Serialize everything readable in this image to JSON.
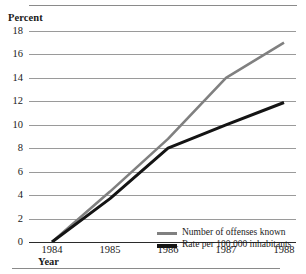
{
  "chart_data": {
    "type": "line",
    "title": "",
    "subtitle": "",
    "ylabel": "Percent",
    "xlabel": "Year",
    "x": [
      "1984",
      "1985",
      "1986",
      "1987",
      "1988"
    ],
    "categories": [
      "1984",
      "1985",
      "1986",
      "1987",
      "1988"
    ],
    "xlim": [
      1984,
      1988
    ],
    "ylim": [
      0,
      18
    ],
    "yticks": [
      "18",
      "16",
      "14",
      "12",
      "10",
      "8",
      "6",
      "4",
      "2",
      "0"
    ],
    "ytick_values": [
      18,
      16,
      14,
      12,
      10,
      8,
      6,
      4,
      2,
      0
    ],
    "xticks": [
      "1984",
      "1985",
      "1986",
      "1987",
      "1988"
    ],
    "grid": "horizontal",
    "legend_position": "inside-center-lower",
    "series": [
      {
        "name": "Number of offenses known",
        "color": "#808080",
        "values": [
          0,
          4.3,
          8.8,
          14.0,
          17.0
        ]
      },
      {
        "name": "Rate per 100,000 inhabitants",
        "color": "#141414",
        "values": [
          0,
          3.7,
          8.0,
          10.0,
          11.9
        ]
      }
    ],
    "annotations": []
  },
  "legend": {
    "items": [
      {
        "label": "Number of offenses known",
        "color": "#808080"
      },
      {
        "label": "Rate per 100,000 inhabitants",
        "color": "#141414"
      }
    ]
  },
  "colors": {
    "gridline": "#9a9a9a",
    "axis": "#2b2b2b",
    "rule": "#8a8a8a",
    "series_gray": "#808080",
    "series_black": "#141414"
  }
}
